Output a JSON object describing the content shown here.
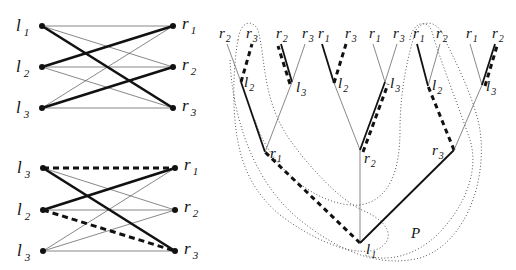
{
  "graph_top": {
    "left_labels": [
      {
        "base": "l",
        "sub": "1"
      },
      {
        "base": "l",
        "sub": "2"
      },
      {
        "base": "l",
        "sub": "3"
      }
    ],
    "right_labels": [
      {
        "base": "r",
        "sub": "1"
      },
      {
        "base": "r",
        "sub": "2"
      },
      {
        "base": "r",
        "sub": "3"
      }
    ],
    "edges": [
      {
        "from": 0,
        "to": 0,
        "style": "thin"
      },
      {
        "from": 0,
        "to": 1,
        "style": "thin"
      },
      {
        "from": 0,
        "to": 2,
        "style": "thick"
      },
      {
        "from": 1,
        "to": 0,
        "style": "thick"
      },
      {
        "from": 1,
        "to": 1,
        "style": "thin"
      },
      {
        "from": 1,
        "to": 2,
        "style": "thin"
      },
      {
        "from": 2,
        "to": 0,
        "style": "thin"
      },
      {
        "from": 2,
        "to": 1,
        "style": "thick"
      },
      {
        "from": 2,
        "to": 2,
        "style": "thin"
      }
    ]
  },
  "graph_bottom": {
    "left_labels": [
      {
        "base": "l",
        "sub": "3"
      },
      {
        "base": "l",
        "sub": "2"
      },
      {
        "base": "l",
        "sub": "3"
      }
    ],
    "right_labels": [
      {
        "base": "r",
        "sub": "1"
      },
      {
        "base": "r",
        "sub": "2"
      },
      {
        "base": "r",
        "sub": "3"
      }
    ],
    "edges": [
      {
        "from": 0,
        "to": 0,
        "style": "dashthick"
      },
      {
        "from": 0,
        "to": 1,
        "style": "thin"
      },
      {
        "from": 0,
        "to": 2,
        "style": "thick"
      },
      {
        "from": 1,
        "to": 0,
        "style": "thick"
      },
      {
        "from": 1,
        "to": 1,
        "style": "thin"
      },
      {
        "from": 1,
        "to": 2,
        "style": "dashthick"
      },
      {
        "from": 2,
        "to": 0,
        "style": "thin"
      },
      {
        "from": 2,
        "to": 1,
        "style": "thin"
      },
      {
        "from": 2,
        "to": 2,
        "style": "thin"
      }
    ]
  },
  "tree": {
    "root": {
      "base": "l",
      "sub": "1"
    },
    "path_label": "P",
    "level1": [
      {
        "base": "r",
        "sub": "1"
      },
      {
        "base": "r",
        "sub": "2"
      },
      {
        "base": "r",
        "sub": "3"
      }
    ],
    "level2": [
      {
        "base": "l",
        "sub": "2"
      },
      {
        "base": "l",
        "sub": "3"
      },
      {
        "base": "l",
        "sub": "2"
      },
      {
        "base": "l",
        "sub": "3"
      },
      {
        "base": "l",
        "sub": "2"
      },
      {
        "base": "l",
        "sub": "3"
      }
    ],
    "leaves": [
      {
        "base": "r",
        "sub": "2"
      },
      {
        "base": "r",
        "sub": "3"
      },
      {
        "base": "r",
        "sub": "2"
      },
      {
        "base": "r",
        "sub": "3"
      },
      {
        "base": "r",
        "sub": "1"
      },
      {
        "base": "r",
        "sub": "3"
      },
      {
        "base": "r",
        "sub": "1"
      },
      {
        "base": "r",
        "sub": "3"
      },
      {
        "base": "r",
        "sub": "1"
      },
      {
        "base": "r",
        "sub": "2"
      },
      {
        "base": "r",
        "sub": "1"
      },
      {
        "base": "r",
        "sub": "2"
      }
    ]
  }
}
